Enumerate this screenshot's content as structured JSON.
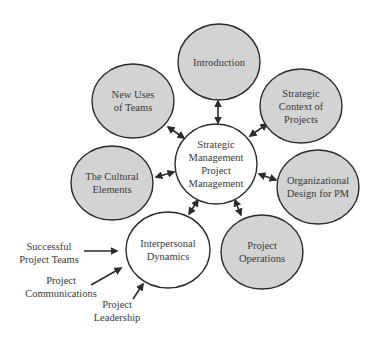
{
  "colors": {
    "filled_node": "#d3d3d3",
    "center_node": "#ffffff",
    "stroke": "#2b2b2b",
    "text": "#3a3a3a",
    "background": "#ffffff"
  },
  "center": {
    "id": "center",
    "lines": [
      "Strategic",
      "Management",
      "Project",
      "Management"
    ],
    "cx": 216,
    "cy": 164,
    "rx": 41,
    "ry": 40,
    "filled": false
  },
  "nodes": [
    {
      "id": "introduction",
      "lines": [
        "Introduction"
      ],
      "cx": 219,
      "cy": 62,
      "rx": 41,
      "ry": 38,
      "filled": true
    },
    {
      "id": "strategic-context",
      "lines": [
        "Strategic",
        "Context of",
        "Projects"
      ],
      "cx": 301,
      "cy": 106,
      "rx": 41,
      "ry": 37,
      "filled": true
    },
    {
      "id": "organizational-design",
      "lines": [
        "Organizational",
        "Design for PM"
      ],
      "cx": 318,
      "cy": 187,
      "rx": 41,
      "ry": 37,
      "filled": true
    },
    {
      "id": "project-operations",
      "lines": [
        "Project",
        "Operations"
      ],
      "cx": 262,
      "cy": 252,
      "rx": 41,
      "ry": 37,
      "filled": true
    },
    {
      "id": "interpersonal-dynamics",
      "lines": [
        "Interpersonal",
        "Dynamics"
      ],
      "cx": 168,
      "cy": 250,
      "rx": 42,
      "ry": 38,
      "filled": false
    },
    {
      "id": "cultural-elements",
      "lines": [
        "The Cultural",
        "Elements"
      ],
      "cx": 112,
      "cy": 183,
      "rx": 41,
      "ry": 37,
      "filled": true
    },
    {
      "id": "new-uses-of-teams",
      "lines": [
        "New Uses",
        "of Teams"
      ],
      "cx": 133,
      "cy": 101,
      "rx": 41,
      "ry": 37,
      "filled": true
    }
  ],
  "connectors": [
    {
      "from": "center",
      "to": "introduction",
      "x1": 218,
      "y1": 101,
      "x2": 218,
      "y2": 123,
      "bidirectional": true
    },
    {
      "from": "center",
      "to": "strategic-context",
      "x1": 250,
      "y1": 136,
      "x2": 267,
      "y2": 124,
      "bidirectional": true
    },
    {
      "from": "center",
      "to": "organizational-design",
      "x1": 259,
      "y1": 174,
      "x2": 276,
      "y2": 180,
      "bidirectional": true
    },
    {
      "from": "center",
      "to": "project-operations",
      "x1": 235,
      "y1": 200,
      "x2": 241,
      "y2": 215,
      "bidirectional": true
    },
    {
      "from": "center",
      "to": "interpersonal-dynamics",
      "x1": 198,
      "y1": 200,
      "x2": 189,
      "y2": 214,
      "bidirectional": true
    },
    {
      "from": "center",
      "to": "cultural-elements",
      "x1": 174,
      "y1": 172,
      "x2": 156,
      "y2": 177,
      "bidirectional": true
    },
    {
      "from": "center",
      "to": "new-uses-of-teams",
      "x1": 184,
      "y1": 138,
      "x2": 168,
      "y2": 127,
      "bidirectional": true
    }
  ],
  "inputs": [
    {
      "id": "successful-project-teams",
      "lines": [
        "Successful",
        "Project Teams"
      ],
      "tx": 49,
      "ty": 250,
      "ax1": 84,
      "ay1": 251,
      "ax2": 117,
      "ay2": 251
    },
    {
      "id": "project-communications",
      "lines": [
        "Project",
        "Communications"
      ],
      "tx": 61,
      "ty": 284,
      "ax1": 91,
      "ay1": 285,
      "ax2": 121,
      "ay2": 268
    },
    {
      "id": "project-leadership",
      "lines": [
        "Project",
        "Leadership"
      ],
      "tx": 117,
      "ty": 308,
      "ax1": 133,
      "ay1": 299,
      "ax2": 143,
      "ay2": 284
    }
  ]
}
